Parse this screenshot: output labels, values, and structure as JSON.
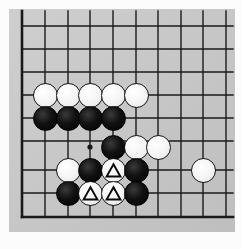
{
  "diagram": {
    "board": {
      "background_color": "#c9c9c9",
      "page_color": "#fcfcfc",
      "line_color": "#1a1a1a",
      "grid_columns": 10,
      "grid_rows": 9,
      "column_x": [
        22,
        45,
        68,
        90,
        113,
        136,
        158,
        181,
        203,
        226
      ],
      "row_y": [
        26,
        49,
        72,
        95,
        118,
        141,
        170,
        193,
        217
      ],
      "edge_lines": [
        "left",
        "bottom"
      ],
      "star_point": {
        "x": 90,
        "y": 147,
        "label": "hoshi"
      }
    },
    "stone_colors": {
      "black": "#0a0a0a",
      "white": "#f7f7f7",
      "outline": "#141414",
      "marker": "triangle"
    },
    "stone_radius": 12.5,
    "stones": [
      {
        "id": "w1",
        "color": "white",
        "x": 45,
        "y": 95,
        "marker": "none"
      },
      {
        "id": "w2",
        "color": "white",
        "x": 68,
        "y": 95,
        "marker": "none"
      },
      {
        "id": "w3",
        "color": "white",
        "x": 90,
        "y": 95,
        "marker": "none"
      },
      {
        "id": "w4",
        "color": "white",
        "x": 113,
        "y": 95,
        "marker": "none"
      },
      {
        "id": "w5",
        "color": "white",
        "x": 136,
        "y": 95,
        "marker": "none"
      },
      {
        "id": "b1",
        "color": "black",
        "x": 45,
        "y": 118,
        "marker": "none"
      },
      {
        "id": "b2",
        "color": "black",
        "x": 68,
        "y": 118,
        "marker": "none"
      },
      {
        "id": "b3",
        "color": "black",
        "x": 90,
        "y": 118,
        "marker": "none"
      },
      {
        "id": "b4",
        "color": "black",
        "x": 113,
        "y": 118,
        "marker": "none"
      },
      {
        "id": "b5",
        "color": "black",
        "x": 113,
        "y": 147,
        "marker": "none"
      },
      {
        "id": "w6",
        "color": "white",
        "x": 136,
        "y": 147,
        "marker": "none"
      },
      {
        "id": "w7",
        "color": "white",
        "x": 158,
        "y": 147,
        "marker": "none"
      },
      {
        "id": "w8",
        "color": "white",
        "x": 68,
        "y": 170,
        "marker": "none"
      },
      {
        "id": "b6",
        "color": "black",
        "x": 90,
        "y": 170,
        "marker": "none"
      },
      {
        "id": "w9",
        "color": "white",
        "x": 113,
        "y": 170,
        "marker": "triangle"
      },
      {
        "id": "b7",
        "color": "black",
        "x": 136,
        "y": 170,
        "marker": "none"
      },
      {
        "id": "w10",
        "color": "white",
        "x": 203,
        "y": 170,
        "marker": "none"
      },
      {
        "id": "b8",
        "color": "black",
        "x": 68,
        "y": 193,
        "marker": "none"
      },
      {
        "id": "w11",
        "color": "white",
        "x": 90,
        "y": 193,
        "marker": "triangle"
      },
      {
        "id": "w12",
        "color": "white",
        "x": 113,
        "y": 193,
        "marker": "triangle"
      },
      {
        "id": "b9",
        "color": "black",
        "x": 136,
        "y": 193,
        "marker": "none"
      }
    ],
    "counts": {
      "black_stones": 9,
      "white_stones": 12,
      "marked_stones": 3
    }
  }
}
